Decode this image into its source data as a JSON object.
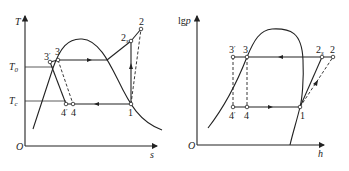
{
  "diagrams": [
    {
      "name": "T-s diagram",
      "y_axis_label": "T",
      "x_axis_label": "s",
      "origin_label": "O",
      "level_labels": [
        {
          "main": "T",
          "sub": "0"
        },
        {
          "main": "T",
          "sub": "c"
        }
      ],
      "points": [
        {
          "main": "3",
          "prime": "′"
        },
        {
          "main": "3",
          "prime": ""
        },
        {
          "main": "2",
          "sub": "s"
        },
        {
          "main": "2",
          "sub": ""
        },
        {
          "main": "1",
          "sub": ""
        },
        {
          "main": "4",
          "prime": "′"
        },
        {
          "main": "4",
          "prime": ""
        }
      ]
    },
    {
      "name": "lgp-h diagram",
      "y_axis_label": "lgp",
      "x_axis_label": "h",
      "origin_label": "O",
      "points": [
        {
          "main": "3",
          "prime": "′"
        },
        {
          "main": "3",
          "prime": ""
        },
        {
          "main": "2",
          "sub": "s"
        },
        {
          "main": "2",
          "sub": ""
        },
        {
          "main": "1",
          "sub": ""
        },
        {
          "main": "4",
          "prime": "′"
        },
        {
          "main": "4",
          "prime": ""
        }
      ]
    }
  ]
}
